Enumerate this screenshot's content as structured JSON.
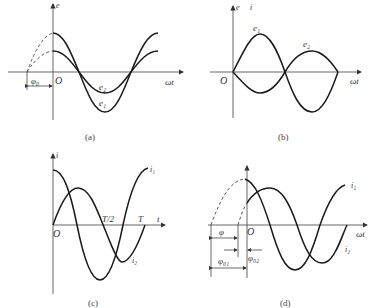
{
  "figure": {
    "panels": [
      {
        "id": "a",
        "caption": "(a)",
        "labels": {
          "y_axis": "e",
          "x_axis": "ωt",
          "origin": "O",
          "phase": "φ₀",
          "curve1": "e₁",
          "curve2": "e₂"
        }
      },
      {
        "id": "b",
        "caption": "(b)",
        "labels": {
          "y_axis": "e",
          "x_axis": "ωt",
          "origin": "O",
          "curve1": "e₁",
          "curve2": "e₂"
        }
      },
      {
        "id": "c",
        "caption": "(c)",
        "labels": {
          "y_axis": "i",
          "x_axis": "t",
          "origin": "O",
          "half_period": "T/2",
          "period": "T",
          "curve1": "i₁",
          "curve2": "i₂"
        }
      },
      {
        "id": "d",
        "caption": "(d)",
        "labels": {
          "y_axis": "i",
          "x_axis": "ωt",
          "origin": "O",
          "phase_diff": "φ",
          "phase1": "φ₀₁",
          "phase2": "φ₀₂",
          "curve1": "i₁",
          "curve2": "i₂"
        }
      }
    ]
  },
  "colors": {
    "curve": "#1a1a1a",
    "axis": "#555555",
    "text": "#333333"
  }
}
